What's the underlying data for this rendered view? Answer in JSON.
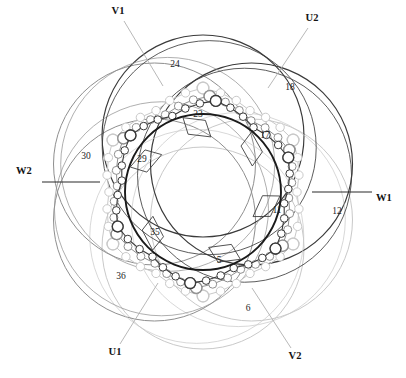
{
  "figure": {
    "slot_count": 36,
    "bore_circle": {
      "cx": 203,
      "cy": 192,
      "r": 78,
      "stroke": "#1a1a1a",
      "width": 1.9
    }
  },
  "colors": {
    "phase_u": "#3a3a3a",
    "phase_v": "#8f8f8f",
    "phase_w": "#c9c9c9",
    "bore": "#1a1a1a",
    "lead": "#2b2b2b",
    "leader": "#b0b0b0",
    "tag": "#3d3d3d",
    "text": "#1a1a1a",
    "background": "#ffffff"
  },
  "terminals": [
    {
      "name": "V1",
      "label": "V1",
      "x": 118,
      "y": 12,
      "anchor": "middle",
      "leader": {
        "x1": 124,
        "y1": 21,
        "x2": 163,
        "y2": 86
      }
    },
    {
      "name": "U2",
      "label": "U2",
      "x": 312,
      "y": 19,
      "anchor": "middle",
      "leader": {
        "x1": 308,
        "y1": 28,
        "x2": 268,
        "y2": 88
      }
    },
    {
      "name": "W2",
      "label": "W2",
      "x": 16,
      "y": 172,
      "anchor": "start",
      "leader": {
        "x1": 42,
        "y1": 182,
        "x2": 100,
        "y2": 182
      }
    },
    {
      "name": "W1",
      "label": "W1",
      "x": 376,
      "y": 199,
      "anchor": "start",
      "leader": {
        "x1": 372,
        "y1": 192,
        "x2": 312,
        "y2": 192
      }
    },
    {
      "name": "U1",
      "label": "U1",
      "x": 115,
      "y": 353,
      "anchor": "middle",
      "leader": {
        "x1": 120,
        "y1": 344,
        "x2": 158,
        "y2": 283
      }
    },
    {
      "name": "V2",
      "label": "V2",
      "x": 295,
      "y": 357,
      "anchor": "middle",
      "leader": {
        "x1": 291,
        "y1": 348,
        "x2": 252,
        "y2": 288
      }
    }
  ],
  "slot_tags": [
    {
      "number": "5",
      "x": 219,
      "y": 261,
      "angle": 70
    },
    {
      "number": "11",
      "x": 277,
      "y": 211,
      "angle": 12
    },
    {
      "number": "17",
      "x": 265,
      "y": 136,
      "angle": -42
    },
    {
      "number": "23",
      "x": 198,
      "y": 115,
      "angle": -96
    },
    {
      "number": "29",
      "x": 142,
      "y": 160,
      "angle": -152
    },
    {
      "number": "35",
      "x": 155,
      "y": 233,
      "angle": 140
    }
  ],
  "outer_numbers": [
    {
      "number": "24",
      "x": 175,
      "y": 65
    },
    {
      "number": "18",
      "x": 290,
      "y": 88
    },
    {
      "number": "12",
      "x": 337,
      "y": 212
    },
    {
      "number": "6",
      "x": 248,
      "y": 309
    },
    {
      "number": "36",
      "x": 121,
      "y": 277
    },
    {
      "number": "30",
      "x": 86,
      "y": 157
    }
  ],
  "coil_arcs": [
    {
      "phase": "U",
      "shade": "dark",
      "cx": 203,
      "cy": 192,
      "r": 103,
      "rot": 0
    },
    {
      "phase": "V",
      "shade": "mid",
      "cx": 203,
      "cy": 192,
      "r": 103,
      "rot": 60
    },
    {
      "phase": "W",
      "shade": "light",
      "cx": 203,
      "cy": 192,
      "r": 103,
      "rot": 120
    }
  ],
  "legend_note": ""
}
